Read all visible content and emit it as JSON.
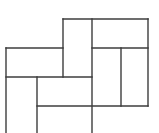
{
  "figure": {
    "kind": "rectangle-tiling-line-drawing",
    "canvas": {
      "width": 159,
      "height": 133
    },
    "background_color": "#ffffff",
    "line_color": "#3d3d3d",
    "line_width": 1.4,
    "segments": [
      {
        "name": "top-edge",
        "x1": 63,
        "y1": 19,
        "x2": 148,
        "y2": 19
      },
      {
        "name": "left-tile-top-edge",
        "x1": 6,
        "y1": 48,
        "x2": 63,
        "y2": 48
      },
      {
        "name": "right-tiles-top-edge",
        "x1": 92,
        "y1": 48,
        "x2": 148,
        "y2": 48
      },
      {
        "name": "middle-divider",
        "x1": 6,
        "y1": 77,
        "x2": 92,
        "y2": 77
      },
      {
        "name": "lower-divider",
        "x1": 37,
        "y1": 106,
        "x2": 148,
        "y2": 106
      },
      {
        "name": "left-edge",
        "x1": 6,
        "y1": 48,
        "x2": 6,
        "y2": 133
      },
      {
        "name": "lower-left-divider",
        "x1": 37,
        "y1": 77,
        "x2": 37,
        "y2": 133
      },
      {
        "name": "upper-center-divider",
        "x1": 63,
        "y1": 19,
        "x2": 63,
        "y2": 77
      },
      {
        "name": "center-divider",
        "x1": 92,
        "y1": 19,
        "x2": 92,
        "y2": 133
      },
      {
        "name": "right-inner-divider",
        "x1": 121,
        "y1": 48,
        "x2": 121,
        "y2": 106
      },
      {
        "name": "right-edge",
        "x1": 148,
        "y1": 19,
        "x2": 148,
        "y2": 106
      }
    ],
    "tiles": [
      {
        "name": "tile-top-center-tall",
        "x": 63,
        "y": 19,
        "w": 29,
        "h": 58
      },
      {
        "name": "tile-top-right-wide",
        "x": 92,
        "y": 19,
        "w": 56,
        "h": 29
      },
      {
        "name": "tile-left-wide",
        "x": 6,
        "y": 48,
        "w": 57,
        "h": 29
      },
      {
        "name": "tile-right-center-tall",
        "x": 92,
        "y": 48,
        "w": 29,
        "h": 58
      },
      {
        "name": "tile-far-right-tall",
        "x": 121,
        "y": 48,
        "w": 27,
        "h": 58
      },
      {
        "name": "tile-center-wide",
        "x": 37,
        "y": 77,
        "w": 55,
        "h": 29
      },
      {
        "name": "tile-bottom-left-tall-clipped",
        "x": 6,
        "y": 77,
        "w": 31,
        "h": 56
      },
      {
        "name": "tile-bottom-center-wide-clipped",
        "x": 37,
        "y": 106,
        "w": 55,
        "h": 27
      }
    ]
  }
}
